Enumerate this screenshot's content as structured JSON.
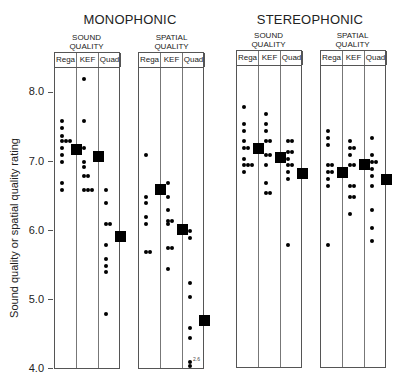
{
  "chart_data": {
    "type": "scatter",
    "title": "",
    "ylabel": "Sound quality or spatial quality rating",
    "ylim": [
      4.0,
      8.0
    ],
    "yticks": [
      "8.0",
      "7.0",
      "6.0",
      "5.0",
      "4.0"
    ],
    "grid": false,
    "groups": [
      {
        "name": "MONOPHONIC",
        "panels": [
          {
            "name": "SOUND\nQUALITY",
            "categories": [
              "Rega",
              "KEF",
              "Quad"
            ],
            "series": [
              {
                "name": "Rega",
                "values": [
                  7.6,
                  7.5,
                  7.38,
                  7.3,
                  7.3,
                  7.3,
                  7.2,
                  7.1,
                  7.0,
                  6.7,
                  6.6
                ],
                "mean": 7.18
              },
              {
                "name": "KEF",
                "values": [
                  8.2,
                  7.6,
                  7.2,
                  7.0,
                  6.93,
                  6.8,
                  6.8,
                  6.6,
                  6.6,
                  6.6
                ],
                "mean": 7.08
              },
              {
                "name": "Quad",
                "values": [
                  6.6,
                  6.4,
                  6.1,
                  6.1,
                  5.8,
                  5.6,
                  5.5,
                  5.4,
                  4.8
                ],
                "mean": 5.92
              }
            ]
          },
          {
            "name": "SPATIAL\nQUALITY",
            "categories": [
              "Rega",
              "KEF",
              "Quad"
            ],
            "series": [
              {
                "name": "Rega",
                "values": [
                  7.1,
                  6.5,
                  6.4,
                  6.2,
                  6.1,
                  5.7,
                  5.7
                ],
                "mean": 6.6
              },
              {
                "name": "KEF",
                "values": [
                  6.7,
                  6.5,
                  6.3,
                  6.15,
                  6.15,
                  6.1,
                  5.75,
                  5.75,
                  5.45
                ],
                "mean": 6.02
              },
              {
                "name": "Quad",
                "values": [
                  6.0,
                  5.9,
                  5.25,
                  5.05,
                  4.6,
                  4.45,
                  4.1,
                  4.0
                ],
                "mean": 4.7
              }
            ],
            "annotation": "2.6"
          }
        ]
      },
      {
        "name": "STEREOPHONIC",
        "panels": [
          {
            "name": "SOUND\nQUALITY",
            "categories": [
              "Rega",
              "KEF",
              "Quad"
            ],
            "series": [
              {
                "name": "Rega",
                "values": [
                  7.8,
                  7.55,
                  7.45,
                  7.3,
                  7.2,
                  7.2,
                  7.05,
                  6.95,
                  6.95,
                  6.95,
                  6.85
                ],
                "mean": 7.2
              },
              {
                "name": "KEF",
                "values": [
                  7.7,
                  7.55,
                  7.45,
                  7.3,
                  7.3,
                  7.1,
                  7.1,
                  6.95,
                  6.7,
                  6.55,
                  6.55
                ],
                "mean": 7.07
              },
              {
                "name": "Quad",
                "values": [
                  7.3,
                  7.3,
                  7.15,
                  7.15,
                  7.05,
                  6.95,
                  6.95,
                  6.85,
                  6.75,
                  5.8
                ],
                "mean": 6.83
              }
            ]
          },
          {
            "name": "SPATIAL\nQUALITY",
            "categories": [
              "Rega",
              "KEF",
              "Quad"
            ],
            "series": [
              {
                "name": "Rega",
                "values": [
                  7.45,
                  7.35,
                  7.25,
                  6.95,
                  6.95,
                  6.85,
                  6.85,
                  6.75,
                  6.65,
                  5.8
                ],
                "mean": 6.85
              },
              {
                "name": "KEF",
                "values": [
                  7.3,
                  7.2,
                  7.2,
                  7.1,
                  6.95,
                  6.95,
                  6.65,
                  6.65,
                  6.5,
                  6.5,
                  6.25
                ],
                "mean": 6.97
              },
              {
                "name": "Quad",
                "values": [
                  7.35,
                  7.1,
                  7.0,
                  7.0,
                  6.9,
                  6.8,
                  6.65,
                  6.3,
                  6.05,
                  5.85
                ],
                "mean": 6.75
              }
            ]
          }
        ]
      }
    ]
  },
  "labels": {
    "group_mono": "MONOPHONIC",
    "group_stereo": "STEREOPHONIC",
    "sound_quality": "SOUND\nQUALITY",
    "spatial_quality": "SPATIAL\nQUALITY",
    "col_rega": "Rega",
    "col_kef": "KEF",
    "col_quad": "Quad",
    "ylabel": "Sound quality or spatial quality rating",
    "tick_8": "8.0",
    "tick_7": "7.0",
    "tick_6": "6.0",
    "tick_5": "5.0",
    "tick_4": "4.0",
    "anno_off_scale": "2.6"
  }
}
